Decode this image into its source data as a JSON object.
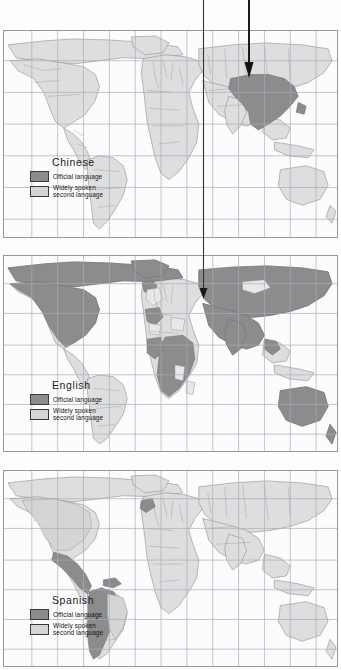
{
  "figure": {
    "panel_count": 3,
    "background_color": "#fdfdfd",
    "frame_color": "#8e9aa8"
  },
  "legend_common": {
    "official_label": "Official language",
    "second_label": "Widely spoken\nsecond language",
    "official_color": "#8c8c8c",
    "second_color": "#d5d5d5",
    "swatch_border_color": "#3a3a3a"
  },
  "panels": [
    {
      "id": "panel-chinese",
      "language": "Chinese",
      "legend_title": "Chinese",
      "official_label": "Official language",
      "second_label": "Widely spoken\nsecond language",
      "official_regions": [
        "China",
        "Taiwan"
      ],
      "second_regions": [
        "North America",
        "South America",
        "Europe",
        "Africa",
        "Asia",
        "Australia"
      ],
      "map": {
        "grid": true,
        "grid_color": "#9fb0c4",
        "vertical_grid_count": 12,
        "horizontal_grid_count": 6,
        "land_color": "#dedede",
        "land_outline_color": "#8a8a8a"
      }
    },
    {
      "id": "panel-english",
      "language": "English",
      "legend_title": "English",
      "official_label": "Official language",
      "second_label": "Widely spoken\nsecond language",
      "official_regions": [
        "United States",
        "Canada",
        "United Kingdom",
        "Ireland",
        "Australia",
        "New Zealand",
        "India",
        "South Africa",
        "Nigeria",
        "Kenya",
        "Egypt-region",
        "Sudan",
        "Madagascar-region"
      ],
      "second_regions": [
        "Mexico",
        "Central America",
        "South America",
        "Europe",
        "Sahara",
        "Mongolia",
        "Southeast Asia"
      ],
      "map": {
        "grid": true,
        "grid_color": "#9fb0c4",
        "vertical_grid_count": 12,
        "horizontal_grid_count": 6,
        "land_color": "#dedede",
        "land_outline_color": "#8a8a8a"
      }
    },
    {
      "id": "panel-spanish",
      "language": "Spanish",
      "legend_title": "Spanish",
      "official_label": "Official language",
      "second_label": "Widely spoken\nsecond language",
      "official_regions": [
        "Mexico",
        "Central America",
        "Cuba",
        "Colombia",
        "Venezuela",
        "Peru",
        "Chile",
        "Argentina",
        "Bolivia",
        "Ecuador",
        "Paraguay",
        "Uruguay",
        "Spain"
      ],
      "second_regions": [
        "United States",
        "Canada",
        "Brazil",
        "Europe",
        "Africa",
        "Asia",
        "Australia"
      ],
      "map": {
        "grid": true,
        "grid_color": "#9fb0c4",
        "vertical_grid_count": 12,
        "horizontal_grid_count": 6,
        "land_color": "#dedede",
        "land_outline_color": "#8a8a8a"
      }
    }
  ],
  "annotations": [
    {
      "id": "annotation-arrow-china",
      "name": "arrow-to-china",
      "target_panel": "panel-chinese",
      "target_region": "China",
      "x": 249,
      "y_start": 0,
      "y_end": 78,
      "stroke_width": 1.9,
      "color": "#111111"
    },
    {
      "id": "annotation-arrow-europe",
      "name": "arrow-to-middle-east",
      "target_panel": "panel-english",
      "target_region": "Turkey / Middle East",
      "x": 203,
      "y_start": 0,
      "y_end": 298,
      "stroke_width": 1.1,
      "color": "#333333"
    }
  ]
}
